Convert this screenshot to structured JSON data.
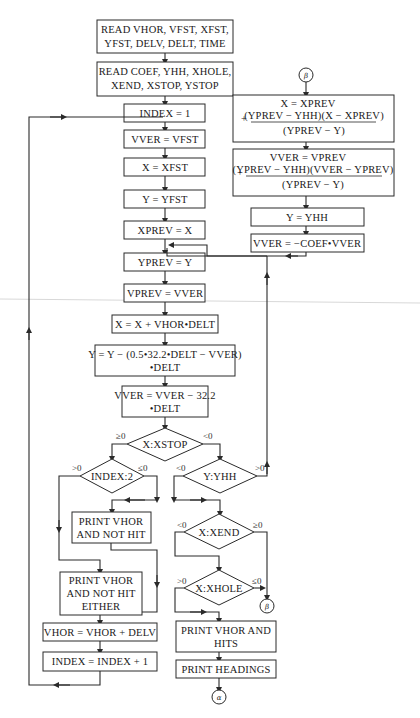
{
  "diagram": {
    "type": "flowchart",
    "boxes": {
      "read1": [
        "READ VHOR, VFST, XFST,",
        "YFST, DELV, DELT, TIME"
      ],
      "read2": [
        "READ COEF, YHH, XHOLE,",
        "XEND, XSTOP, YSTOP"
      ],
      "index_init": "INDEX = 1",
      "vver_init": "VVER = VFST",
      "x_init": "X = XFST",
      "y_init": "Y = YFST",
      "xprev": "XPREV = X",
      "yprev": "YPREV = Y",
      "vprev": "VPREV = VVER",
      "x_update": "X = X + VHOR•DELT",
      "y_update": [
        "Y = Y − (0.5•32.2•DELT − VVER)",
        "•DELT"
      ],
      "vver_update": [
        "VVER = VVER − 32.2",
        "•DELT"
      ],
      "print_not_hit": [
        "PRINT VHOR",
        "AND NOT HIT"
      ],
      "print_not_hit_either": [
        "PRINT VHOR",
        "AND NOT HIT",
        "EITHER"
      ],
      "vhor_update": "VHOR = VHOR + DELV",
      "index_update": "INDEX = INDEX + 1",
      "print_hits": [
        "PRINT VHOR AND",
        "HITS"
      ],
      "print_headings": "PRINT HEADINGS",
      "x_interp": {
        "line1": "X = XPREV",
        "num": "(YPREV − YHH)(X − XPREV)",
        "den": "(YPREV − Y)",
        "plus": "+"
      },
      "vver_interp": {
        "line1": "VVER = VPREV",
        "num": "(YPREV − YHH)(VVER − YPREV)",
        "den": "(YPREV − Y)",
        "plus": "+"
      },
      "y_set": "Y = YHH",
      "vver_bounce": "VVER = −COEF•VVER"
    },
    "decisions": {
      "xstop": {
        "label": "X:XSTOP",
        "left": "≥0",
        "right": "<0"
      },
      "index": {
        "label": "INDEX:2",
        "left": ">0",
        "right": "≤0"
      },
      "yhh": {
        "label": "Y:YHH",
        "left": "<0",
        "right": ">0"
      },
      "xend": {
        "label": "X:XEND",
        "left": "<0",
        "right": "≥0"
      },
      "xhole": {
        "label": "X:XHOLE",
        "left": ">0",
        "right": "≤0"
      }
    },
    "connectors": {
      "beta": "β",
      "alpha": "α"
    }
  }
}
